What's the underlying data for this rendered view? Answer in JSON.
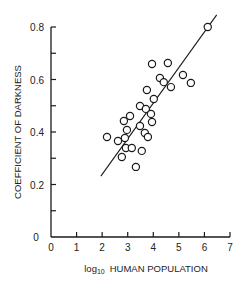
{
  "chart_data": {
    "type": "scatter",
    "title": "",
    "xlabel": "log10 HUMAN POPULATION",
    "xlabel_prefix": "log",
    "xlabel_sub": "10",
    "xlabel_main": "HUMAN POPULATION",
    "ylabel": "COEFFICIENT OF DARKNESS",
    "xlim": [
      0,
      7
    ],
    "ylim": [
      0,
      0.8
    ],
    "x_ticks": [
      0,
      1,
      2,
      3,
      4,
      5,
      6,
      7
    ],
    "x_tick_labels": [
      "0",
      "1",
      "2",
      "3",
      "4",
      "5",
      "6",
      "7"
    ],
    "y_ticks": [
      0,
      0.1,
      0.2,
      0.3,
      0.4,
      0.5,
      0.6,
      0.7,
      0.8
    ],
    "y_tick_labels": [
      "0",
      "",
      "0.2",
      "",
      "0.4",
      "",
      "0.6",
      "",
      "0.8"
    ],
    "grid": false,
    "legend": null,
    "marker": "open-circle",
    "points": [
      {
        "x": 2.19,
        "y": 0.381
      },
      {
        "x": 2.62,
        "y": 0.366
      },
      {
        "x": 2.89,
        "y": 0.377
      },
      {
        "x": 2.85,
        "y": 0.442
      },
      {
        "x": 3.09,
        "y": 0.461
      },
      {
        "x": 2.97,
        "y": 0.408
      },
      {
        "x": 2.93,
        "y": 0.339
      },
      {
        "x": 2.77,
        "y": 0.305
      },
      {
        "x": 3.16,
        "y": 0.339
      },
      {
        "x": 3.32,
        "y": 0.267
      },
      {
        "x": 3.55,
        "y": 0.328
      },
      {
        "x": 3.48,
        "y": 0.423
      },
      {
        "x": 3.48,
        "y": 0.499
      },
      {
        "x": 3.67,
        "y": 0.396
      },
      {
        "x": 3.79,
        "y": 0.381
      },
      {
        "x": 3.71,
        "y": 0.488
      },
      {
        "x": 3.75,
        "y": 0.56
      },
      {
        "x": 3.91,
        "y": 0.469
      },
      {
        "x": 3.95,
        "y": 0.438
      },
      {
        "x": 4.02,
        "y": 0.526
      },
      {
        "x": 3.95,
        "y": 0.659
      },
      {
        "x": 4.26,
        "y": 0.606
      },
      {
        "x": 4.41,
        "y": 0.59
      },
      {
        "x": 4.57,
        "y": 0.663
      },
      {
        "x": 4.69,
        "y": 0.571
      },
      {
        "x": 5.16,
        "y": 0.617
      },
      {
        "x": 5.47,
        "y": 0.587
      },
      {
        "x": 6.13,
        "y": 0.8
      }
    ],
    "regression_line": {
      "x1": 1.95,
      "y1": 0.232,
      "x2": 6.48,
      "y2": 0.846
    },
    "colors": {
      "ink": "#1a1a1a",
      "background": "#ffffff"
    }
  }
}
